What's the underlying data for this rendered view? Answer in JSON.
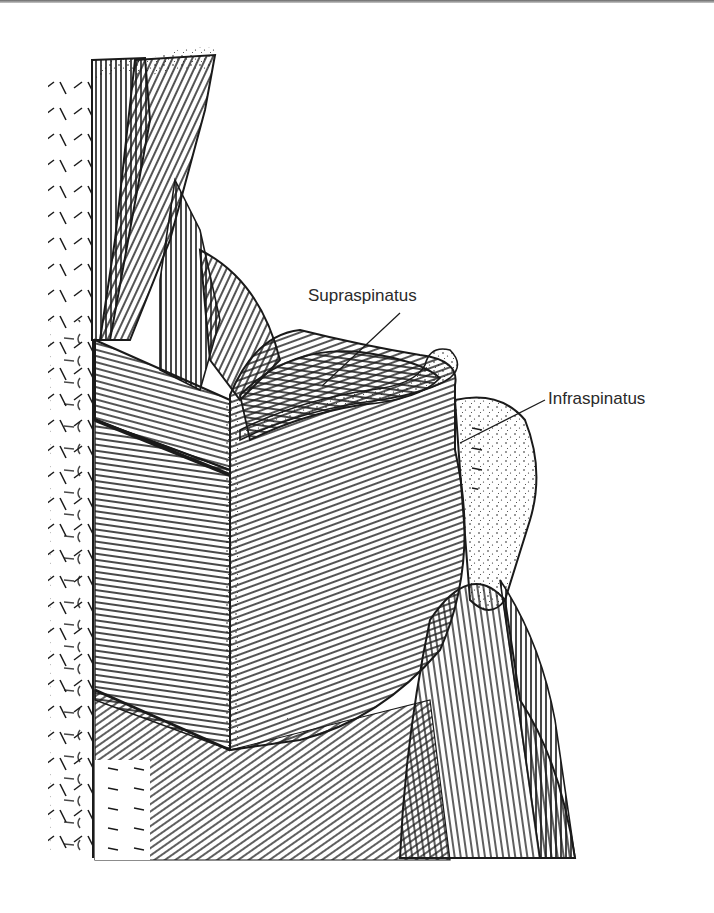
{
  "figure": {
    "colors": {
      "ink": "#1a1a1a",
      "paper": "#ffffff",
      "label_text": "#2a2a2a"
    }
  },
  "labels": [
    {
      "id": "supraspinatus",
      "text": "Supraspinatus",
      "text_x": 308,
      "text_y": 287,
      "leader_from": [
        400,
        313
      ],
      "leader_to": [
        322,
        386
      ]
    },
    {
      "id": "infraspinatus",
      "text": "Infraspinatus",
      "text_x": 548,
      "text_y": 390,
      "leader_from": [
        545,
        400
      ],
      "leader_to": [
        460,
        443
      ]
    }
  ]
}
